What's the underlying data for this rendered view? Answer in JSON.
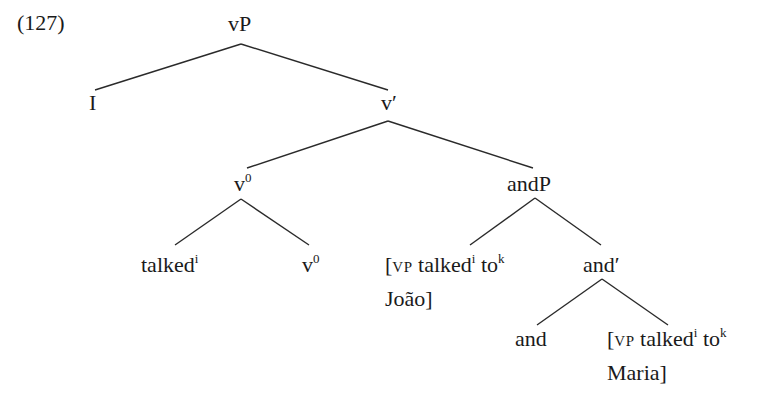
{
  "example_number": "(127)",
  "tree": {
    "root": {
      "label": "vP"
    },
    "specifier": {
      "label": "I"
    },
    "v_bar": {
      "label": "v",
      "prime": "′"
    },
    "v0_head": {
      "label": "v",
      "sup": "0"
    },
    "talked_leaf": {
      "label": "talked",
      "sup": "i"
    },
    "v0_leaf": {
      "label": "v",
      "sup": "0"
    },
    "andP": {
      "label": "andP"
    },
    "conjunct1": {
      "bracket_open": "[",
      "subscript": "VP",
      "word1": " talked",
      "sup1": "i",
      "word2": " to",
      "sup2": "k",
      "line2": "João]"
    },
    "and_bar": {
      "label": "and",
      "prime": "′"
    },
    "and_head": {
      "label": "and"
    },
    "conjunct2": {
      "bracket_open": "[",
      "subscript": "VP",
      "word1": " talked",
      "sup1": "i",
      "word2": " to",
      "sup2": "k",
      "line2": "Maria]"
    }
  },
  "edges": [
    {
      "from": "vP",
      "to": "I",
      "x1": 241,
      "y1": 44,
      "x2": 95,
      "y2": 90
    },
    {
      "from": "vP",
      "to": "v-bar",
      "x1": 241,
      "y1": 44,
      "x2": 388,
      "y2": 90
    },
    {
      "from": "v-bar",
      "to": "v0",
      "x1": 388,
      "y1": 121,
      "x2": 247,
      "y2": 168
    },
    {
      "from": "v-bar",
      "to": "andP",
      "x1": 388,
      "y1": 121,
      "x2": 533,
      "y2": 168
    },
    {
      "from": "v0",
      "to": "talked",
      "x1": 241,
      "y1": 199,
      "x2": 175,
      "y2": 245
    },
    {
      "from": "v0",
      "to": "v0-leaf",
      "x1": 241,
      "y1": 199,
      "x2": 309,
      "y2": 245
    },
    {
      "from": "andP",
      "to": "conjunct1",
      "x1": 535,
      "y1": 198,
      "x2": 470,
      "y2": 245
    },
    {
      "from": "andP",
      "to": "and-bar",
      "x1": 535,
      "y1": 198,
      "x2": 601,
      "y2": 245
    },
    {
      "from": "and-bar",
      "to": "and",
      "x1": 602,
      "y1": 279,
      "x2": 537,
      "y2": 325
    },
    {
      "from": "and-bar",
      "to": "conjunct2",
      "x1": 602,
      "y1": 279,
      "x2": 668,
      "y2": 325
    }
  ],
  "line_color": "#2a2a2a"
}
